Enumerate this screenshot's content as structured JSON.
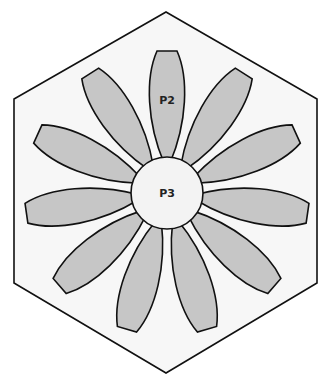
{
  "diagram": {
    "type": "quilt-pattern-template",
    "shape": "hexagon",
    "colors": {
      "background": "#ffffff",
      "hexagon_fill": "#f7f7f7",
      "petal_fill": "#c6c6c6",
      "center_fill": "#f3f3f3",
      "stroke": "#111111"
    },
    "hexagon": {
      "points": [
        [
          166,
          12
        ],
        [
          317,
          99
        ],
        [
          317,
          283
        ],
        [
          166,
          373
        ],
        [
          14,
          283
        ],
        [
          14,
          99
        ]
      ]
    },
    "center": {
      "cx": 167,
      "cy": 193,
      "r": 36,
      "label": "P3"
    },
    "petals": {
      "count": 11,
      "start_angle_deg": 0,
      "labeled_petal": {
        "index": 0,
        "label": "P2"
      }
    }
  }
}
